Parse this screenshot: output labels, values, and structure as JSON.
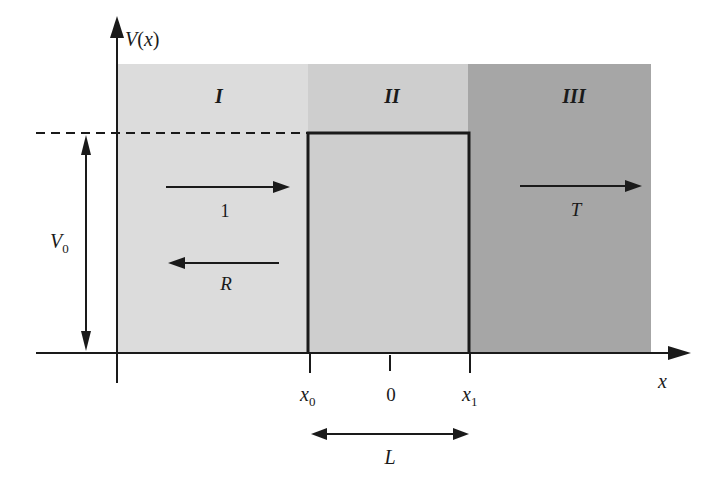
{
  "diagram": {
    "y_axis_label": "V(x)",
    "y_axis_label_parts": {
      "main": "V",
      "paren_open": "(",
      "var": "x",
      "paren_close": ")"
    },
    "x_axis_label": "x",
    "barrier_height_label": {
      "main": "V",
      "sub": "0"
    },
    "regions": [
      {
        "name": "I",
        "color": "#dcdcdc"
      },
      {
        "name": "II",
        "color": "#cecece"
      },
      {
        "name": "III",
        "color": "#a6a6a6"
      }
    ],
    "ticks": [
      {
        "main": "x",
        "sub": "0"
      },
      {
        "main": "0",
        "sub": ""
      },
      {
        "main": "x",
        "sub": "1"
      }
    ],
    "width_label": "L",
    "waves": {
      "incident": "1",
      "reflected": "R",
      "transmitted": "T"
    },
    "colors": {
      "line": "#1a1a1a",
      "background": "#ffffff"
    }
  }
}
